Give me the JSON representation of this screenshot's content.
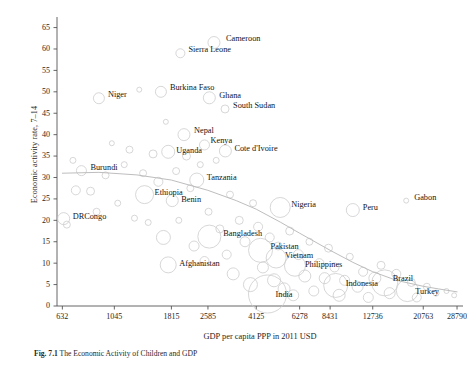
{
  "figure": {
    "caption_prefix": "Fig. 7.1",
    "caption_text": "The Economic Activity of Children and GDP"
  },
  "chart_data": {
    "type": "scatter",
    "title": "",
    "xlabel": "GDP per capita PPP in 2011 USD",
    "ylabel": "Economic activity rate, 7–14",
    "xscale": "log",
    "xlim": [
      600,
      30500
    ],
    "ylim": [
      0,
      67
    ],
    "yticks": [
      0,
      5,
      10,
      15,
      20,
      25,
      30,
      35,
      40,
      45,
      50,
      55,
      60,
      65
    ],
    "xticks": [
      632,
      1045,
      1815,
      2585,
      4125,
      6278,
      8431,
      12736,
      20763,
      28790
    ],
    "xtick_labels": [
      "632",
      "1045",
      "1815",
      "2585",
      "4125",
      "6278",
      "8431",
      "12736",
      "20763",
      "28790"
    ],
    "grid": false,
    "legend": null,
    "marker_style": "open-circle-bubble",
    "marker_color": "#c9c9c9",
    "trend_line": {
      "style": "smoothed-lowess",
      "color": "#b9b9b9",
      "points": [
        {
          "x": 632,
          "y": 31.0
        },
        {
          "x": 900,
          "y": 31.2
        },
        {
          "x": 1300,
          "y": 30.6
        },
        {
          "x": 1815,
          "y": 29.4
        },
        {
          "x": 2585,
          "y": 27.0
        },
        {
          "x": 3400,
          "y": 24.6
        },
        {
          "x": 4125,
          "y": 22.6
        },
        {
          "x": 5200,
          "y": 19.6
        },
        {
          "x": 6278,
          "y": 17.0
        },
        {
          "x": 8431,
          "y": 13.0
        },
        {
          "x": 10500,
          "y": 10.2
        },
        {
          "x": 12736,
          "y": 8.0
        },
        {
          "x": 16000,
          "y": 6.0
        },
        {
          "x": 20763,
          "y": 4.6
        },
        {
          "x": 24000,
          "y": 4.0
        },
        {
          "x": 28790,
          "y": 3.3
        }
      ]
    },
    "labeled_points": [
      {
        "name": "Cameroon",
        "x": 2740,
        "y": 61.5,
        "size": 12,
        "lx": 12,
        "ly": -4
      },
      {
        "name": "Sierra Leone",
        "x": 1980,
        "y": 59.0,
        "size": 9,
        "lx": 8,
        "ly": -3
      },
      {
        "name": "Burkina Faso",
        "x": 1640,
        "y": 50.0,
        "size": 11,
        "lx": 9,
        "ly": -4
      },
      {
        "name": "Niger",
        "x": 900,
        "y": 48.5,
        "size": 11,
        "lx": 9,
        "ly": -3
      },
      {
        "name": "Ghana",
        "x": 2620,
        "y": 48.6,
        "size": 12,
        "lx": 10,
        "ly": -2
      },
      {
        "name": "South Sudan",
        "x": 3050,
        "y": 46.0,
        "size": 8,
        "lx": 8,
        "ly": -3
      },
      {
        "name": "Nepal",
        "x": 2050,
        "y": 40.0,
        "size": 12,
        "lx": 10,
        "ly": -4
      },
      {
        "name": "Kenya",
        "x": 2500,
        "y": 37.6,
        "size": 10,
        "lx": 6,
        "ly": -4
      },
      {
        "name": "Uganda",
        "x": 1760,
        "y": 36.0,
        "size": 13,
        "lx": 8,
        "ly": -1
      },
      {
        "name": "Cote d'Ivoire",
        "x": 3060,
        "y": 36.2,
        "size": 12,
        "lx": 9,
        "ly": -2
      },
      {
        "name": "Burundi",
        "x": 760,
        "y": 31.6,
        "size": 10,
        "lx": 9,
        "ly": -3
      },
      {
        "name": "Tanzania",
        "x": 2320,
        "y": 29.4,
        "size": 14,
        "lx": 10,
        "ly": -2
      },
      {
        "name": "Ethiopia",
        "x": 1400,
        "y": 26.0,
        "size": 18,
        "lx": 10,
        "ly": -2
      },
      {
        "name": "Benin",
        "x": 1830,
        "y": 24.6,
        "size": 12,
        "lx": 9,
        "ly": -1
      },
      {
        "name": "DRCongo",
        "x": 640,
        "y": 20.4,
        "size": 12,
        "lx": 9,
        "ly": -2
      },
      {
        "name": "Nigeria",
        "x": 5200,
        "y": 23.0,
        "size": 20,
        "lx": 11,
        "ly": -2
      },
      {
        "name": "Peru",
        "x": 10500,
        "y": 22.4,
        "size": 13,
        "lx": 10,
        "ly": -2
      },
      {
        "name": "Gabon",
        "x": 17600,
        "y": 24.6,
        "size": 5,
        "lx": 8,
        "ly": -3
      },
      {
        "name": "Bangladesh",
        "x": 2620,
        "y": 16.2,
        "size": 23,
        "lx": 14,
        "ly": -3
      },
      {
        "name": "Afghanistan",
        "x": 1760,
        "y": 9.6,
        "size": 16,
        "lx": 11,
        "ly": -1
      },
      {
        "name": "Pakistan",
        "x": 4300,
        "y": 13.0,
        "size": 24,
        "lx": 10,
        "ly": -3
      },
      {
        "name": "Vietnam",
        "x": 5000,
        "y": 11.2,
        "size": 20,
        "lx": 9,
        "ly": -2
      },
      {
        "name": "Philippines",
        "x": 6000,
        "y": 9.4,
        "size": 21,
        "lx": 10,
        "ly": -1
      },
      {
        "name": "Indonesia",
        "x": 8900,
        "y": 4.8,
        "size": 24,
        "lx": 10,
        "ly": -1
      },
      {
        "name": "India",
        "x": 4600,
        "y": 2.8,
        "size": 38,
        "lx": 8,
        "ly": 1
      },
      {
        "name": "Brazil",
        "x": 14300,
        "y": 5.4,
        "size": 26,
        "lx": 8,
        "ly": -4
      },
      {
        "name": "Turkey",
        "x": 17800,
        "y": 3.6,
        "size": 22,
        "lx": 8,
        "ly": 1
      }
    ],
    "unlabeled_points": [
      {
        "x": 700,
        "y": 34.0,
        "size": 6
      },
      {
        "x": 720,
        "y": 27.0,
        "size": 9
      },
      {
        "x": 660,
        "y": 19.0,
        "size": 7
      },
      {
        "x": 830,
        "y": 26.8,
        "size": 8
      },
      {
        "x": 880,
        "y": 22.0,
        "size": 7
      },
      {
        "x": 960,
        "y": 30.5,
        "size": 7
      },
      {
        "x": 1020,
        "y": 38.0,
        "size": 5
      },
      {
        "x": 1080,
        "y": 24.0,
        "size": 6
      },
      {
        "x": 1150,
        "y": 33.0,
        "size": 6
      },
      {
        "x": 1210,
        "y": 36.5,
        "size": 7
      },
      {
        "x": 1270,
        "y": 20.5,
        "size": 6
      },
      {
        "x": 1330,
        "y": 50.5,
        "size": 5
      },
      {
        "x": 1380,
        "y": 31.0,
        "size": 7
      },
      {
        "x": 1450,
        "y": 19.5,
        "size": 6
      },
      {
        "x": 1520,
        "y": 35.5,
        "size": 8
      },
      {
        "x": 1600,
        "y": 29.0,
        "size": 9
      },
      {
        "x": 1680,
        "y": 16.0,
        "size": 14
      },
      {
        "x": 1720,
        "y": 43.0,
        "size": 5
      },
      {
        "x": 1900,
        "y": 31.5,
        "size": 7
      },
      {
        "x": 1950,
        "y": 20.0,
        "size": 6
      },
      {
        "x": 2100,
        "y": 35.0,
        "size": 8
      },
      {
        "x": 2180,
        "y": 27.5,
        "size": 7
      },
      {
        "x": 2260,
        "y": 14.0,
        "size": 10
      },
      {
        "x": 2400,
        "y": 33.0,
        "size": 6
      },
      {
        "x": 2500,
        "y": 10.5,
        "size": 9
      },
      {
        "x": 2600,
        "y": 22.0,
        "size": 7
      },
      {
        "x": 2800,
        "y": 34.0,
        "size": 6
      },
      {
        "x": 2900,
        "y": 18.0,
        "size": 8
      },
      {
        "x": 3100,
        "y": 12.0,
        "size": 9
      },
      {
        "x": 3200,
        "y": 26.0,
        "size": 7
      },
      {
        "x": 3300,
        "y": 7.5,
        "size": 12
      },
      {
        "x": 3500,
        "y": 20.0,
        "size": 8
      },
      {
        "x": 3700,
        "y": 15.0,
        "size": 10
      },
      {
        "x": 3900,
        "y": 5.0,
        "size": 14
      },
      {
        "x": 4000,
        "y": 24.0,
        "size": 7
      },
      {
        "x": 4200,
        "y": 18.5,
        "size": 9
      },
      {
        "x": 4400,
        "y": 9.0,
        "size": 11
      },
      {
        "x": 4700,
        "y": 16.0,
        "size": 9
      },
      {
        "x": 4900,
        "y": 6.0,
        "size": 13
      },
      {
        "x": 5100,
        "y": 14.0,
        "size": 8
      },
      {
        "x": 5400,
        "y": 4.0,
        "size": 12
      },
      {
        "x": 5700,
        "y": 17.5,
        "size": 8
      },
      {
        "x": 5900,
        "y": 2.5,
        "size": 11
      },
      {
        "x": 6200,
        "y": 12.0,
        "size": 10
      },
      {
        "x": 6600,
        "y": 7.0,
        "size": 12
      },
      {
        "x": 6900,
        "y": 15.0,
        "size": 7
      },
      {
        "x": 7200,
        "y": 3.5,
        "size": 10
      },
      {
        "x": 7600,
        "y": 10.0,
        "size": 9
      },
      {
        "x": 8000,
        "y": 6.5,
        "size": 11
      },
      {
        "x": 8300,
        "y": 13.5,
        "size": 8
      },
      {
        "x": 8800,
        "y": 9.0,
        "size": 9
      },
      {
        "x": 9200,
        "y": 2.5,
        "size": 12
      },
      {
        "x": 9700,
        "y": 6.0,
        "size": 10
      },
      {
        "x": 10200,
        "y": 11.5,
        "size": 7
      },
      {
        "x": 11000,
        "y": 4.5,
        "size": 11
      },
      {
        "x": 11600,
        "y": 8.0,
        "size": 9
      },
      {
        "x": 12200,
        "y": 2.0,
        "size": 10
      },
      {
        "x": 13000,
        "y": 6.5,
        "size": 12
      },
      {
        "x": 13800,
        "y": 9.5,
        "size": 8
      },
      {
        "x": 15000,
        "y": 3.0,
        "size": 11
      },
      {
        "x": 16000,
        "y": 7.5,
        "size": 9
      },
      {
        "x": 18500,
        "y": 5.5,
        "size": 8
      },
      {
        "x": 19500,
        "y": 2.0,
        "size": 9
      },
      {
        "x": 21500,
        "y": 4.5,
        "size": 7
      },
      {
        "x": 23500,
        "y": 3.0,
        "size": 6
      },
      {
        "x": 26000,
        "y": 3.5,
        "size": 5
      },
      {
        "x": 28000,
        "y": 2.5,
        "size": 5
      }
    ]
  }
}
